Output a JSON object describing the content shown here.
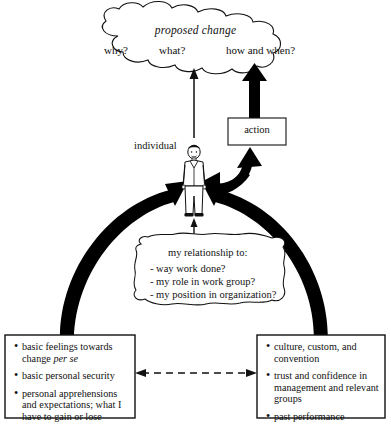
{
  "diagram": {
    "cloud": {
      "title": "proposed change",
      "questions": [
        "why?",
        "what?",
        "how and when?"
      ]
    },
    "individual_label": "individual",
    "action_label": "action",
    "callout": {
      "heading": "my relationship to:",
      "items": [
        "- way work done?",
        "- my role in work group?",
        "- my position in organization?"
      ]
    },
    "left_box": {
      "items": [
        {
          "pre": "basic feelings towards change ",
          "italic": "per se",
          "post": ""
        },
        {
          "pre": "basic personal security",
          "italic": "",
          "post": ""
        },
        {
          "pre": "personal apprehensions and expectations; what I have to gain or lose",
          "italic": "",
          "post": ""
        }
      ]
    },
    "right_box": {
      "items": [
        {
          "pre": "culture, custom, and convention",
          "italic": "",
          "post": ""
        },
        {
          "pre": "trust and confidence in management and relevant groups",
          "italic": "",
          "post": ""
        },
        {
          "pre": "past performance",
          "italic": "",
          "post": ""
        }
      ]
    },
    "caption": "",
    "colors": {
      "ink": "#111111",
      "arrow_fill": "#000000",
      "background": "#ffffff"
    }
  }
}
